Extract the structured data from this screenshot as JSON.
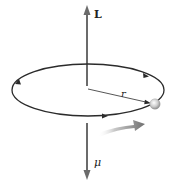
{
  "diagram": {
    "labels": {
      "angular_momentum": "L",
      "radius": "r",
      "magnetic_moment": "μ"
    },
    "elements": {
      "angular_momentum_vector": {
        "direction": "up",
        "symbol": "L"
      },
      "magnetic_moment_vector": {
        "direction": "down",
        "symbol": "μ"
      },
      "orbit": {
        "shape": "ellipse",
        "direction_markers": 3
      },
      "particle": {
        "shape": "sphere"
      },
      "motion_arrow": {
        "direction": "right"
      }
    },
    "colors": {
      "vector": "#6b6b6b",
      "orbit": "#2b2b2b",
      "particle": "#c8c8c8",
      "motion_arrow": "#7a7a7a"
    }
  }
}
